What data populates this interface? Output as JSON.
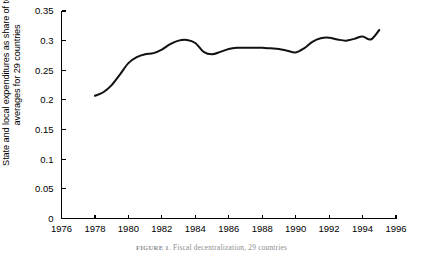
{
  "figure": {
    "caption_label": "FIGURE 1.",
    "caption_text": "Fiscal decentralization, 29 countries"
  },
  "axes": {
    "ylabel_line1": "State and local expenditures as share of total,",
    "ylabel_line2": "averages for 29 countries",
    "xlabel": "",
    "y_ticks": [
      "0",
      "0.05",
      "0.1",
      "0.15",
      "0.2",
      "0.25",
      "0.3",
      "0.35"
    ],
    "x_ticks": [
      "1976",
      "1978",
      "1980",
      "1982",
      "1984",
      "1986",
      "1988",
      "1990",
      "1992",
      "1994",
      "1996"
    ]
  },
  "colors": {
    "line": "#111111",
    "axis": "#000000",
    "background": "#ffffff"
  },
  "chart_data": {
    "type": "line",
    "title": "",
    "xlabel": "",
    "ylabel": "State and local expenditures as share of total, averages for 29 countries",
    "xlim": [
      1976,
      1996
    ],
    "ylim": [
      0,
      0.35
    ],
    "grid": false,
    "legend": false,
    "x_tick_values": [
      1976,
      1978,
      1980,
      1982,
      1984,
      1986,
      1988,
      1990,
      1992,
      1994,
      1996
    ],
    "y_tick_values": [
      0,
      0.05,
      0.1,
      0.15,
      0.2,
      0.25,
      0.3,
      0.35
    ],
    "series": [
      {
        "name": "State and local share of total expenditures",
        "x": [
          1978,
          1978.5,
          1979,
          1979.5,
          1980,
          1980.5,
          1981,
          1981.5,
          1982,
          1982.5,
          1983,
          1983.5,
          1984,
          1984.5,
          1985,
          1985.5,
          1986,
          1986.5,
          1987,
          1987.5,
          1988,
          1988.5,
          1989,
          1989.5,
          1990,
          1990.5,
          1991,
          1991.5,
          1992,
          1992.5,
          1993,
          1993.5,
          1994,
          1994.5,
          1995
        ],
        "values": [
          0.207,
          0.213,
          0.225,
          0.243,
          0.262,
          0.272,
          0.277,
          0.279,
          0.285,
          0.294,
          0.3,
          0.301,
          0.296,
          0.281,
          0.277,
          0.281,
          0.286,
          0.288,
          0.288,
          0.288,
          0.288,
          0.287,
          0.286,
          0.283,
          0.28,
          0.287,
          0.298,
          0.304,
          0.305,
          0.302,
          0.3,
          0.303,
          0.307,
          0.302,
          0.318
        ]
      }
    ]
  }
}
